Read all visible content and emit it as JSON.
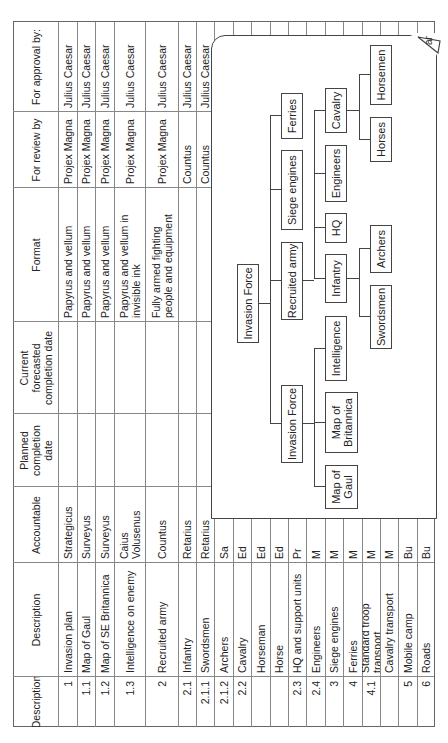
{
  "table": {
    "headers": [
      "Description",
      "Description",
      "Accountable",
      "Planned\ncompletion\ndate",
      "Current\nforecasted\ncompletion date",
      "Format",
      "For review by",
      "For approval by:"
    ],
    "rows": [
      {
        "id": "1",
        "description": "Invasion plan",
        "accountable": "Strategicus",
        "planned": "",
        "forecast": "",
        "format": "Papyrus and vellum",
        "review": "Projex Magna",
        "approval": "Julius Caesar"
      },
      {
        "id": "1.1",
        "description": "Map of Gaul",
        "accountable": "Surveyus",
        "planned": "",
        "forecast": "",
        "format": "Papyrus and vellum",
        "review": "Projex Magna",
        "approval": "Julius Caesar"
      },
      {
        "id": "1.2",
        "description": "Map of SE Britannica",
        "accountable": "Surveyus",
        "planned": "",
        "forecast": "",
        "format": "Papyrus and vellum",
        "review": "Projex Magna",
        "approval": "Julius Caesar"
      },
      {
        "id": "1.3",
        "description": "    Intelligence on enemy",
        "accountable": "Caius\nVolusenus",
        "planned": "",
        "forecast": "",
        "format": "Papyrus and vellum in\ninvisible ink",
        "review": "Projex Magna",
        "approval": "Julius Caesar"
      },
      {
        "id": "2",
        "description": "Recruited army",
        "accountable": "Countus",
        "planned": "",
        "forecast": "",
        "format": "Fully armed fighting\npeople and equipment",
        "review": "Projex Magna",
        "approval": "Julius Caesar"
      },
      {
        "id": "2.1",
        "description": "Infantry",
        "accountable": "Retarius",
        "planned": "",
        "forecast": "",
        "format": "",
        "review": "Countus",
        "approval": "Julius Caesar"
      },
      {
        "id": "2.1.1",
        "description": "    Swordsmen",
        "accountable": "Retarius",
        "planned": "",
        "forecast": "",
        "format": "",
        "review": "Countus",
        "approval": "Julius Caesar"
      },
      {
        "id": "2.1.2",
        "description": "    Archers",
        "accountable": "Sa",
        "planned": "",
        "forecast": "",
        "format": "",
        "review": "",
        "approval": ""
      },
      {
        "id": "2.2",
        "description": "Cavalry",
        "accountable": "Ed",
        "planned": "",
        "forecast": "",
        "format": "",
        "review": "",
        "approval": ""
      },
      {
        "id": "",
        "description": "    Horseman",
        "accountable": "Ed",
        "planned": "",
        "forecast": "",
        "format": "",
        "review": "",
        "approval": ""
      },
      {
        "id": "",
        "description": "    Horse",
        "accountable": "Ed",
        "planned": "",
        "forecast": "",
        "format": "",
        "review": "",
        "approval": ""
      },
      {
        "id": "2.3",
        "description": "HQ and support units",
        "accountable": "Pr",
        "planned": "",
        "forecast": "",
        "format": "",
        "review": "",
        "approval": ""
      },
      {
        "id": "2.4",
        "description": "Engineers",
        "accountable": "M",
        "planned": "",
        "forecast": "",
        "format": "",
        "review": "",
        "approval": ""
      },
      {
        "id": "3",
        "description": "Siege engines",
        "accountable": "M",
        "planned": "",
        "forecast": "",
        "format": "",
        "review": "",
        "approval": ""
      },
      {
        "id": "4",
        "description": "Ferries",
        "accountable": "M",
        "planned": "",
        "forecast": "",
        "format": "",
        "review": "",
        "approval": ""
      },
      {
        "id": "4.1",
        "description": "Standard troop transport",
        "accountable": "M",
        "planned": "",
        "forecast": "",
        "format": "",
        "review": "",
        "approval": ""
      },
      {
        "id": "",
        "description": "    Cavalry transport",
        "accountable": "M",
        "planned": "",
        "forecast": "",
        "format": "",
        "review": "",
        "approval": ""
      },
      {
        "id": "5",
        "description": "Mobile camp",
        "accountable": "Bu",
        "planned": "",
        "forecast": "",
        "format": "",
        "review": "",
        "approval": ""
      },
      {
        "id": "6",
        "description": "Roads",
        "accountable": "Bu",
        "planned": "",
        "forecast": "",
        "format": "",
        "review": "",
        "approval": ""
      }
    ]
  },
  "diagram": {
    "curl_label": "ar",
    "nodes": {
      "root": "Invasion Force",
      "plan": "Invasion Force",
      "recruited": "Recruited army",
      "siege": "Siege engines",
      "ferries": "Ferries",
      "map_gaul": "Map of\nGaul",
      "map_britannica": "Map of\nBritannica",
      "intelligence": "Intelligence",
      "infantry": "Infantry",
      "hq": "HQ",
      "engineers": "Engineers",
      "cavalry": "Cavalry",
      "swordsmen": "Swordsmen",
      "archers": "Archers",
      "horses": "Horses",
      "horsemen": "Horsemen"
    }
  }
}
